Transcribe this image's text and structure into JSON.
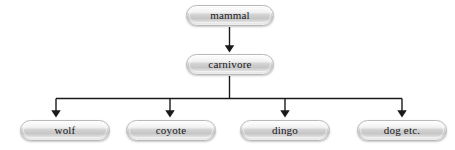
{
  "diagram": {
    "type": "hierarchy-tree",
    "background_color": "#ffffff",
    "edge_color": "#1a1a1a",
    "node_border_color": "#b9b9b9",
    "node_text_color": "#17171a",
    "nodes": [
      {
        "id": "mammal",
        "label": "mammal",
        "level": 0,
        "x": 186,
        "y": 5,
        "width": 88,
        "height": 21
      },
      {
        "id": "carnivore",
        "label": "carnivore",
        "level": 1,
        "x": 186,
        "y": 54,
        "width": 88,
        "height": 21
      },
      {
        "id": "wolf",
        "label": "wolf",
        "level": 2,
        "x": 20,
        "y": 120,
        "width": 90,
        "height": 21
      },
      {
        "id": "coyote",
        "label": "coyote",
        "level": 2,
        "x": 126,
        "y": 120,
        "width": 90,
        "height": 21
      },
      {
        "id": "dingo",
        "label": "dingo",
        "level": 2,
        "x": 240,
        "y": 120,
        "width": 90,
        "height": 21
      },
      {
        "id": "dog-etc",
        "label": "dog etc.",
        "level": 2,
        "x": 357,
        "y": 120,
        "width": 90,
        "height": 21
      }
    ],
    "edges": [
      {
        "from": "mammal",
        "to": "carnivore",
        "arrow": true
      },
      {
        "from": "carnivore",
        "to": "wolf",
        "arrow": true
      },
      {
        "from": "carnivore",
        "to": "coyote",
        "arrow": true
      },
      {
        "from": "carnivore",
        "to": "dingo",
        "arrow": true
      },
      {
        "from": "carnivore",
        "to": "dog-etc",
        "arrow": true
      }
    ]
  }
}
